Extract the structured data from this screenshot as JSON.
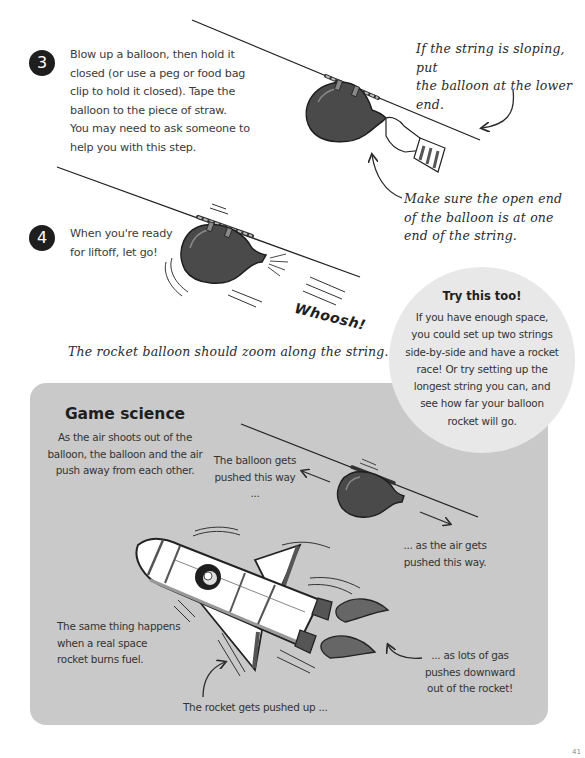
{
  "steps": [
    {
      "number": "3",
      "lines": [
        "Blow up a balloon, then hold it",
        "closed (or use a peg or food bag",
        "clip to hold it closed). Tape the",
        "balloon to the piece of straw.",
        "You may need to ask someone to",
        "help you with this step."
      ]
    },
    {
      "number": "4",
      "lines": [
        "When you're ready",
        "for liftoff, let go!"
      ]
    }
  ],
  "annotations": {
    "sloping": [
      "If the string is sloping, put",
      "the balloon at the lower end."
    ],
    "open_end": [
      "Make sure the open end",
      "of the balloon is at one",
      "end of the string."
    ],
    "whoosh": "Whoosh!",
    "zoom_caption": "The rocket balloon should zoom along the string."
  },
  "try_this": {
    "title": "Try this too!",
    "lines": [
      "If you have enough space,",
      "you could set up two strings",
      "side-by-side and have a rocket",
      "race! Or try setting up the",
      "longest string you can, and",
      "see how far your balloon",
      "rocket will go."
    ]
  },
  "game_science": {
    "title": "Game science",
    "intro": [
      "As the air shoots out of the",
      "balloon, the balloon and the air",
      "push away from each other."
    ],
    "balloon_pushed": [
      "The balloon gets",
      "pushed this way ..."
    ],
    "air_pushed": [
      "... as the air gets",
      "pushed this way."
    ],
    "same_thing": [
      "The same thing happens",
      "when a real space",
      "rocket burns fuel."
    ],
    "rocket_up": "The rocket gets pushed up ...",
    "gas_down": [
      "... as lots of gas",
      "pushes downward",
      "out of the rocket!"
    ]
  },
  "page_number": "41",
  "colors": {
    "badge": "#1e1e1e",
    "balloon": "#4a4a4a",
    "box_bg": "#c9c9c9",
    "circle_bg": "#e8e8e8"
  }
}
